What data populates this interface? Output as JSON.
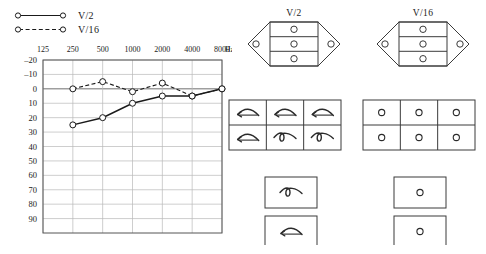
{
  "legend": {
    "items": [
      {
        "label": "V/2",
        "style": "solid",
        "marker": "open-circle"
      },
      {
        "label": "V/16",
        "style": "dashed",
        "marker": "open-circle"
      }
    ]
  },
  "chart_data": {
    "type": "line",
    "title": "",
    "xlabel": "Hz",
    "ylabel": "",
    "x_unit_label": "Hz",
    "categories": [
      "125",
      "250",
      "500",
      "1000",
      "2000",
      "4000",
      "8000"
    ],
    "xtick_labels": [
      "125",
      "250",
      "500",
      "1000",
      "2000",
      "4000",
      "8000"
    ],
    "ytick_labels": [
      "-20",
      "-10",
      "0",
      "10",
      "20",
      "30",
      "40",
      "50",
      "60",
      "70",
      "80",
      "90"
    ],
    "ylim": [
      -20,
      100
    ],
    "y_inverted": true,
    "grid": true,
    "legend_position": "above-left",
    "series": [
      {
        "name": "V/2",
        "style": "solid",
        "marker": "open-circle",
        "x": [
          "250",
          "500",
          "1000",
          "2000",
          "4000",
          "8000"
        ],
        "values": [
          25,
          20,
          10,
          5,
          5,
          0
        ]
      },
      {
        "name": "V/16",
        "style": "dashed",
        "marker": "open-circle",
        "x": [
          "250",
          "500",
          "1000",
          "2000",
          "4000",
          "8000"
        ],
        "values": [
          0,
          -5,
          2,
          -4,
          5,
          0
        ]
      }
    ]
  },
  "diagrams": {
    "hexagons": [
      {
        "title": "V/2",
        "rows": 3,
        "cell_symbol": "circle",
        "left_wing_symbol": "circle",
        "right_wing_symbol": "circle"
      },
      {
        "title": "V/16",
        "rows": 3,
        "cell_symbol": "circle",
        "left_wing_symbol": "circle",
        "right_wing_symbol": "circle"
      }
    ],
    "grid_left": {
      "cols": 3,
      "rows": 2,
      "cells": [
        "curved-arrow-left",
        "curved-arrow-left",
        "curved-arrow-left",
        "curved-arrow-left",
        "loop-squiggle",
        "loop-squiggle"
      ]
    },
    "grid_right": {
      "cols": 3,
      "rows": 2,
      "cells": [
        "circle",
        "circle",
        "circle",
        "circle",
        "circle",
        "circle"
      ]
    },
    "boxes_left": [
      {
        "symbol": "loop-squiggle"
      },
      {
        "symbol": "curved-arrow-left"
      }
    ],
    "boxes_right": [
      {
        "symbol": "circle"
      },
      {
        "symbol": "circle"
      }
    ]
  },
  "colors": {
    "ink": "#1a1a1a",
    "grid": "#b9b9b9",
    "frame": "#555555",
    "background": "#ffffff"
  }
}
